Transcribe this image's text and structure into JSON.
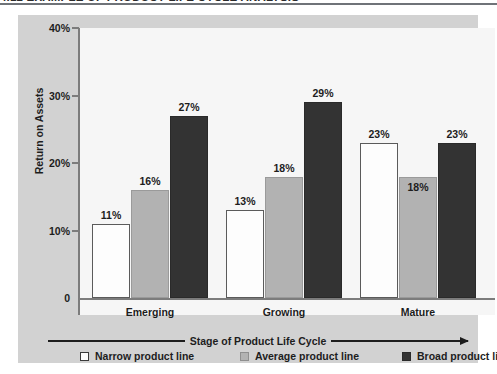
{
  "figure": {
    "title": "4.12 EXAMPLE OF PRODUCT LIFE CYCLE ANALYSIS"
  },
  "chart_data": {
    "type": "bar",
    "title": "",
    "xlabel": "Stage of Product Life Cycle",
    "ylabel": "Return on Assets",
    "categories": [
      "Emerging",
      "Growing",
      "Mature"
    ],
    "ylim": [
      0,
      40
    ],
    "ytick_labels": [
      "0",
      "10%",
      "20%",
      "30%",
      "40%"
    ],
    "ytick_values": [
      0,
      10,
      20,
      30,
      40
    ],
    "grid": false,
    "legend_position": "bottom",
    "series": [
      {
        "name": "Narrow product line",
        "color": "#fdfdfd",
        "values": [
          11,
          13,
          23
        ],
        "labels": [
          "11%",
          "13%",
          "23%"
        ]
      },
      {
        "name": "Average product line",
        "color": "#b2b2b2",
        "values": [
          16,
          18,
          18
        ],
        "labels": [
          "16%",
          "18%",
          "18%"
        ]
      },
      {
        "name": "Broad product line",
        "color": "#333333",
        "values": [
          27,
          29,
          23
        ],
        "labels": [
          "27%",
          "29%",
          "23%"
        ]
      }
    ]
  },
  "axis": {
    "y_title": "Return on Assets",
    "x_title": "Stage of Product Life Cycle",
    "ticks": [
      {
        "label": "40%",
        "value": 40
      },
      {
        "label": "30%",
        "value": 30
      },
      {
        "label": "20%",
        "value": 20
      },
      {
        "label": "10%",
        "value": 10
      },
      {
        "label": "0",
        "value": 0
      }
    ]
  },
  "groups": [
    {
      "label": "Emerging",
      "bars": [
        {
          "series": "narrow",
          "value": 11,
          "label": "11%"
        },
        {
          "series": "average",
          "value": 16,
          "label": "16%"
        },
        {
          "series": "broad",
          "value": 27,
          "label": "27%"
        }
      ]
    },
    {
      "label": "Growing",
      "bars": [
        {
          "series": "narrow",
          "value": 13,
          "label": "13%"
        },
        {
          "series": "average",
          "value": 18,
          "label": "18%"
        },
        {
          "series": "broad",
          "value": 29,
          "label": "29%"
        }
      ]
    },
    {
      "label": "Mature",
      "bars": [
        {
          "series": "narrow",
          "value": 23,
          "label": "23%"
        },
        {
          "series": "average",
          "value": 18,
          "label": "18%"
        },
        {
          "series": "broad",
          "value": 23,
          "label": "23%"
        }
      ]
    }
  ],
  "legend": [
    {
      "key": "narrow",
      "label": "Narrow product line",
      "color": "#fdfdfd"
    },
    {
      "key": "average",
      "label": "Average product line",
      "color": "#b2b2b2"
    },
    {
      "key": "broad",
      "label": "Broad product line",
      "color": "#333333"
    }
  ]
}
